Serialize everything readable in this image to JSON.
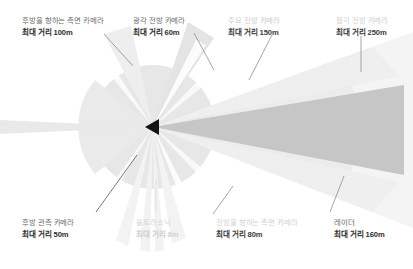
{
  "diagram": {
    "vehicle_marker": "vehicle-triangle",
    "apex": {
      "x": 153,
      "y": 127
    },
    "colors": {
      "background": "#ffffff",
      "radar_cone": "#c3c3c3",
      "wide_cone": "#d9d9d9",
      "disc": "#e6e6e6",
      "pale_wedge": "#efefef",
      "very_pale": "#f6f6f6",
      "marker": "#1a1a1a",
      "leader_line": "#8d8d8d",
      "text_dark": "#2e2e2e",
      "text_light": "#cdcdcd"
    },
    "sensors": [
      {
        "id": "rear-facing-side-camera",
        "name": "후방을 향하는 측면 카메라",
        "range": "최대 거리 100m",
        "range_m": 100,
        "style": "norm"
      },
      {
        "id": "wide-forward-camera",
        "name": "광각 전방 카메라",
        "range": "최대 거리 60m",
        "range_m": 60,
        "style": "norm"
      },
      {
        "id": "main-forward-camera",
        "name": "주요 전방 카메라",
        "range": "최대 거리 150m",
        "range_m": 150,
        "style": "dim"
      },
      {
        "id": "narrow-forward-camera",
        "name": "협각 전방 카메라",
        "range": "최대 거리 250m",
        "range_m": 250,
        "style": "faint2"
      },
      {
        "id": "rear-view-camera",
        "name": "후방 관측 카메라",
        "range": "최대 거리 50m",
        "range_m": 50,
        "style": "norm"
      },
      {
        "id": "ultrasonic",
        "name": "울트라소닉",
        "range": "최대 거리 8m",
        "range_m": 8,
        "style": "faint"
      },
      {
        "id": "forward-facing-side-camera",
        "name": "전방을 향하는 측면 카메라",
        "range": "최대 거리 80m",
        "range_m": 80,
        "style": "faint2"
      },
      {
        "id": "radar",
        "name": "레이더",
        "range": "최대 거리 160m",
        "range_m": 160,
        "style": "norm"
      }
    ]
  }
}
